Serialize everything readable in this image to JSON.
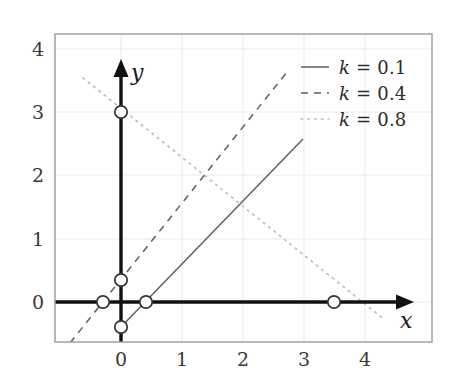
{
  "chart_data": {
    "type": "line",
    "title": "",
    "xlabel": "x",
    "ylabel": "y",
    "xlim": [
      -0.93,
      5.1
    ],
    "ylim": [
      -0.63,
      4.23
    ],
    "xticks": [
      0,
      1,
      2,
      3,
      4
    ],
    "yticks": [
      0,
      1,
      2,
      3,
      4
    ],
    "xtick_labels": [
      "0",
      "1",
      "2",
      "3",
      "4"
    ],
    "ytick_labels": [
      "0",
      "1",
      "2",
      "3",
      "4"
    ],
    "grid": true,
    "legend_position": "top-right",
    "series": [
      {
        "name": "k = 0.1",
        "k": 0.1,
        "style": "solid",
        "color": "#555555",
        "slope": 1.0,
        "intercept": -0.4,
        "x_start": -0.06,
        "x_end": 2.98,
        "markers": [
          {
            "x": 0.0,
            "y": -0.4
          },
          {
            "x": 0.4,
            "y": 0.0
          }
        ]
      },
      {
        "name": "k = 0.4",
        "k": 0.4,
        "style": "dashed",
        "color": "#555555",
        "slope": 1.2,
        "intercept": 0.35,
        "x_start": -0.83,
        "x_end": 2.73,
        "markers": [
          {
            "x": -0.29,
            "y": 0.0
          },
          {
            "x": 0.0,
            "y": 0.35
          }
        ]
      },
      {
        "name": "k = 0.8",
        "k": 0.8,
        "style": "dotted",
        "color": "#b4b4b4",
        "slope": -0.857,
        "intercept": 3.0,
        "x_start": -0.62,
        "x_end": 4.32,
        "markers": [
          {
            "x": 0.0,
            "y": 3.0
          },
          {
            "x": 3.5,
            "y": 0.0
          }
        ]
      }
    ],
    "axis_arrows": {
      "x_axis": {
        "from": {
          "x": -0.93,
          "y": 0
        },
        "to": {
          "x": 4.45,
          "y": 0
        }
      },
      "y_axis": {
        "from": {
          "x": 0,
          "y": -0.63
        },
        "to": {
          "x": 0,
          "y": 3.62
        }
      }
    },
    "marker_style": "open-circle"
  },
  "axis_labels": {
    "x": "x",
    "y": "y"
  },
  "legend": {
    "entries": [
      {
        "label": "k = 0.1",
        "symbol": "k",
        "equals": "=",
        "value": "0.1",
        "dash": "solid"
      },
      {
        "label": "k = 0.4",
        "symbol": "k",
        "equals": "=",
        "value": "0.4",
        "dash": "dashed"
      },
      {
        "label": "k = 0.8",
        "symbol": "k",
        "equals": "=",
        "value": "0.8",
        "dash": "dotted"
      }
    ]
  },
  "xtick_labels": {
    "t0": "0",
    "t1": "1",
    "t2": "2",
    "t3": "3",
    "t4": "4"
  },
  "ytick_labels": {
    "t0": "0",
    "t1": "1",
    "t2": "2",
    "t3": "3",
    "t4": "4"
  },
  "colors": {
    "frame": "#9a9a9a",
    "grid": "#e8e8e8",
    "axis": "#111111",
    "line_dark": "#555555",
    "line_light": "#b4b4b4",
    "text": "#2b2b2b"
  }
}
